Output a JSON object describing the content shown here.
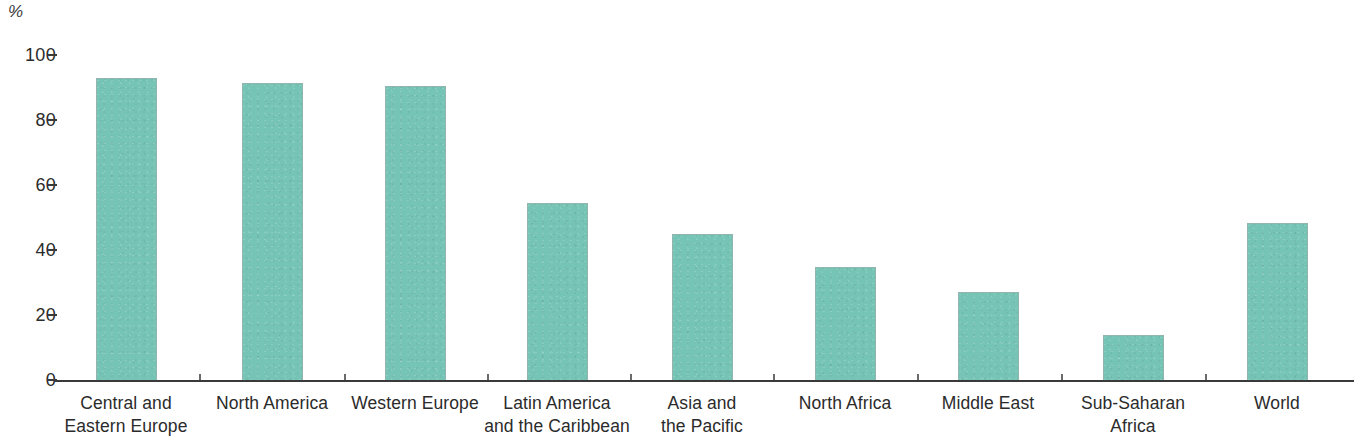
{
  "chart_data": {
    "type": "bar",
    "title": "",
    "xlabel": "",
    "ylabel": "%",
    "ylim": [
      0,
      100
    ],
    "yticks": [
      0,
      20,
      40,
      60,
      80,
      100
    ],
    "ytick_labels": [
      "0",
      "20",
      "40",
      "60",
      "80",
      "100"
    ],
    "grid": false,
    "legend": false,
    "bar_color": "#76c4b6",
    "axis_color": "#3a3a3a",
    "categories": [
      "Central and Eastern Europe",
      "North America",
      "Western Europe",
      "Latin America and the Caribbean",
      "Asia and the Pacific",
      "North Africa",
      "Middle East",
      "Sub-Saharan Africa",
      "World"
    ],
    "category_lines": [
      [
        "Central and",
        "Eastern Europe"
      ],
      [
        "North America"
      ],
      [
        "Western Europe"
      ],
      [
        "Latin America",
        "and the Caribbean"
      ],
      [
        "Asia and",
        "the Pacific"
      ],
      [
        "North Africa"
      ],
      [
        "Middle East"
      ],
      [
        "Sub-Saharan",
        "Africa"
      ],
      [
        "World"
      ]
    ],
    "values": [
      93,
      91.5,
      90.5,
      54.5,
      45,
      34.7,
      27,
      14,
      48.3
    ]
  },
  "axis": {
    "unit_label": "%"
  }
}
